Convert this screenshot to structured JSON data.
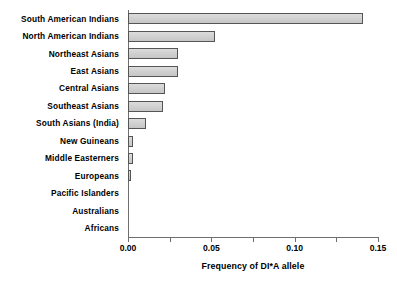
{
  "chart_data": {
    "type": "bar",
    "orientation": "horizontal",
    "title": "",
    "xlabel": "Frequency of DI*A allele",
    "ylabel": "",
    "xlim": [
      0.0,
      0.15
    ],
    "xticks": [
      "0.00",
      "0.05",
      "0.10",
      "0.15"
    ],
    "xtick_values": [
      0.0,
      0.05,
      0.1,
      0.15
    ],
    "grid": false,
    "legend": null,
    "bar_fill_color": "#d2d2d2",
    "bar_edge_color": "#555555",
    "axis_color": "#6e6e6e",
    "categories": [
      "South American Indians",
      "North American Indians",
      "Northeast Asians",
      "East Asians",
      "Central Asians",
      "Southeast Asians",
      "South Asians (India)",
      "New Guineans",
      "Middle Easterners",
      "Europeans",
      "Pacific Islanders",
      "Australians",
      "Africans"
    ],
    "values": [
      0.141,
      0.052,
      0.03,
      0.03,
      0.022,
      0.021,
      0.011,
      0.003,
      0.003,
      0.002,
      0.0,
      0.0,
      0.0
    ]
  }
}
